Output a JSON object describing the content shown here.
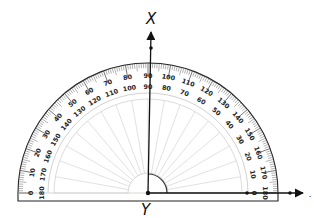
{
  "diagram": {
    "type": "protractor-angle",
    "labels": {
      "ray_x": "X",
      "vertex": "Y",
      "ray_z_fragment": "."
    },
    "outer_scale": {
      "description": "Outer numbers, increasing left to right",
      "values": [
        0,
        10,
        20,
        30,
        40,
        50,
        60,
        70,
        80,
        90,
        100,
        110,
        120,
        130,
        140,
        150,
        160,
        170,
        180
      ]
    },
    "inner_scale": {
      "description": "Inner numbers, decreasing left to right",
      "values": [
        180,
        170,
        160,
        150,
        140,
        130,
        120,
        110,
        100,
        90,
        80,
        70,
        60,
        50,
        40,
        30,
        20,
        10,
        0
      ]
    },
    "measured_angle_degrees": 90,
    "colors": {
      "stroke": "#222222",
      "light_lines": "#cccccc",
      "background": "#ffffff"
    }
  }
}
